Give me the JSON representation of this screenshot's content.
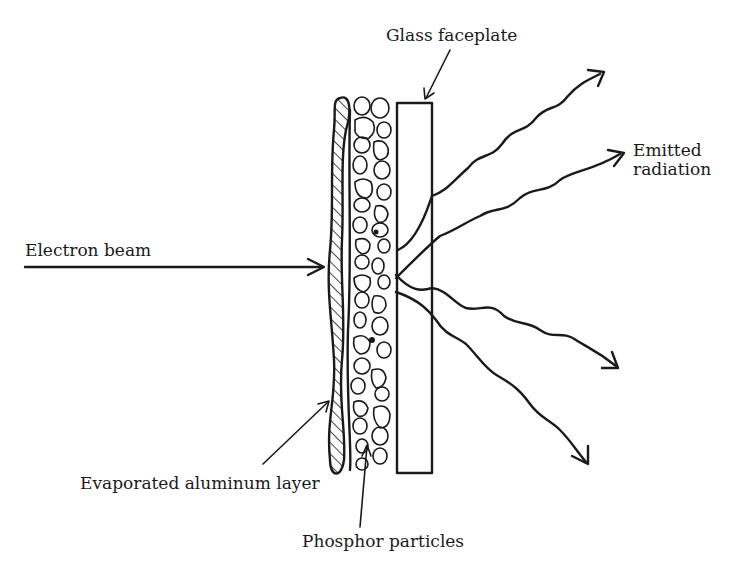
{
  "diagram": {
    "labels": {
      "glass_faceplate": "Glass faceplate",
      "emitted_radiation_line1": "Emitted",
      "emitted_radiation_line2": "radiation",
      "electron_beam": "Electron beam",
      "aluminum_layer": "Evaporated aluminum layer",
      "phosphor_particles": "Phosphor particles"
    },
    "components": [
      {
        "name": "Electron beam",
        "type": "arrow",
        "direction": "right"
      },
      {
        "name": "Evaporated aluminum layer",
        "type": "hatched wavy layer"
      },
      {
        "name": "Phosphor particles",
        "type": "particle layer"
      },
      {
        "name": "Glass faceplate",
        "type": "rectangle"
      },
      {
        "name": "Emitted radiation",
        "type": "wavy arrows",
        "count": 4
      }
    ],
    "colors": {
      "ink": "#1a1a1a",
      "background": "#ffffff"
    }
  }
}
